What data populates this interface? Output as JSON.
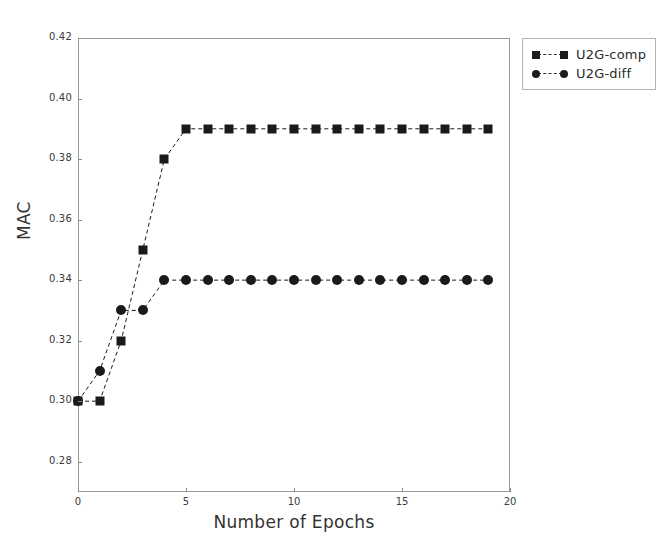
{
  "chart_data": {
    "type": "line",
    "title": "",
    "xlabel": "Number of Epochs",
    "ylabel": "MAC",
    "x": [
      0,
      1,
      2,
      3,
      4,
      5,
      6,
      7,
      8,
      9,
      10,
      11,
      12,
      13,
      14,
      15,
      16,
      17,
      18,
      19
    ],
    "series": [
      {
        "name": "U2G-comp",
        "marker": "square",
        "linestyle": "dashed",
        "color": "#1a1a1a",
        "values": [
          0.3,
          0.3,
          0.32,
          0.35,
          0.38,
          0.39,
          0.39,
          0.39,
          0.39,
          0.39,
          0.39,
          0.39,
          0.39,
          0.39,
          0.39,
          0.39,
          0.39,
          0.39,
          0.39,
          0.39
        ]
      },
      {
        "name": "U2G-diff",
        "marker": "circle",
        "linestyle": "dashed",
        "color": "#1a1a1a",
        "values": [
          0.3,
          0.31,
          0.33,
          0.33,
          0.34,
          0.34,
          0.34,
          0.34,
          0.34,
          0.34,
          0.34,
          0.34,
          0.34,
          0.34,
          0.34,
          0.34,
          0.34,
          0.34,
          0.34,
          0.34
        ]
      }
    ],
    "xlim": [
      0,
      20
    ],
    "ylim": [
      0.27,
      0.42
    ],
    "xticks": [
      0,
      5,
      10,
      15,
      20
    ],
    "xtick_labels": [
      "0",
      "5",
      "10",
      "15",
      "20"
    ],
    "yticks": [
      0.28,
      0.3,
      0.32,
      0.34,
      0.36,
      0.38,
      0.4,
      0.42
    ],
    "ytick_labels": [
      "0.28",
      "0.30",
      "0.32",
      "0.34",
      "0.36",
      "0.38",
      "0.40",
      "0.42"
    ],
    "grid": false,
    "legend_position": "upper right outside",
    "legend_entries": [
      "U2G-comp",
      "U2G-diff"
    ],
    "background": "#ffffff",
    "frame_color": "#9a9a9a"
  },
  "legend": {
    "entries": [
      {
        "label": "U2G-comp"
      },
      {
        "label": "U2G-diff"
      }
    ]
  },
  "axes": {
    "xlabel": "Number of Epochs",
    "ylabel": "MAC"
  }
}
